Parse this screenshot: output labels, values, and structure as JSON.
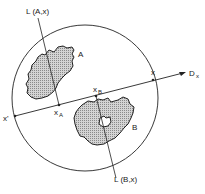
{
  "diagram": {
    "labels": {
      "line_a": "L (A,x)",
      "line_b": "L (B,x)",
      "region_a": "A",
      "region_b": "B",
      "point_x": "x",
      "point_x_prime": "x'",
      "point_xa_main": "x",
      "point_xa_sub": "A",
      "point_xb_main": "x",
      "point_xb_sub": "B",
      "direction_main": "D",
      "direction_sub": "x"
    },
    "colors": {
      "stroke": "#222222",
      "fill_pattern": "#b8b8b8",
      "background": "#ffffff"
    }
  }
}
